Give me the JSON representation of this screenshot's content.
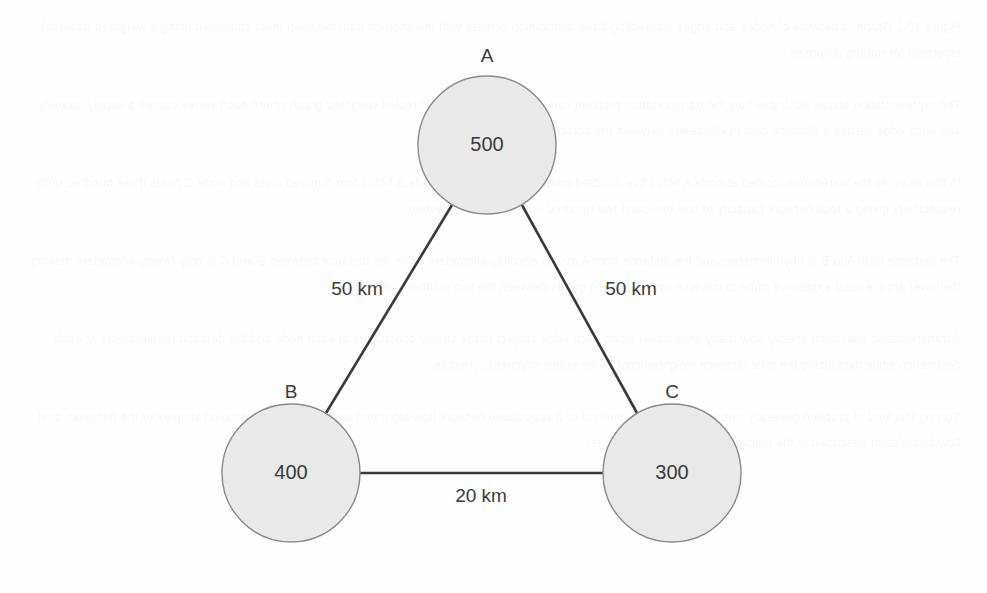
{
  "diagram": {
    "type": "node-link-graph",
    "background_color": "#fefefe",
    "node_fill_color": "#e9e9e9",
    "node_stroke_color": "#8a8a8a",
    "edge_color": "#3a3a3a",
    "text_color": "#3b3b3b",
    "nodes": [
      {
        "id": "A",
        "name": "A",
        "value": "500",
        "cx": 487,
        "cy": 145,
        "r": 69,
        "label_x": 487,
        "label_y": 62
      },
      {
        "id": "B",
        "name": "B",
        "value": "400",
        "cx": 291,
        "cy": 473,
        "r": 69,
        "label_x": 291,
        "label_y": 398
      },
      {
        "id": "C",
        "name": "C",
        "value": "300",
        "cx": 672,
        "cy": 473,
        "r": 69,
        "label_x": 672,
        "label_y": 398
      }
    ],
    "edges": [
      {
        "id": "AB",
        "from": "A",
        "to": "B",
        "label": "50 km",
        "label_x": 357,
        "label_y": 295,
        "x1": 452,
        "y1": 205,
        "x2": 326,
        "y2": 413
      },
      {
        "id": "AC",
        "from": "A",
        "to": "C",
        "label": "50 km",
        "label_x": 631,
        "label_y": 295,
        "x1": 522,
        "y1": 205,
        "x2": 637,
        "y2": 413
      },
      {
        "id": "BC",
        "from": "B",
        "to": "C",
        "label": "20 km",
        "label_x": 481,
        "label_y": 502,
        "x1": 360,
        "y1": 473,
        "x2": 603,
        "y2": 473
      }
    ]
  },
  "ghost_text": "Figure 10-1 Graph  a network of nodes and edges connecting three distribution centers with the shortest path between them computed using a weighted traversal algorithm for routing purposes\n\nThe representation above illustrates how the transportation problem can be modeled as an undirected weighted graph where each vertex carries a supply quantity and each edge carries a distance cost in kilometers between the adjacent facilities\n\nIn this example the warehouse located at node A holds five hundred units of inventory while node B holds four hundred units and node C holds three hundred units respectively giving a total network capacity of one thousand two hundred units across the system\n\nThe distance from A to B is fifty kilometers and the distance from A to C is also fifty kilometers while the distance between B and C is only twenty kilometers making the lower arc the least expensive route to traverse when shipping goods between the two southern centers\n\nA transportation plan must specify how many units travel along each edge subject to the supply constraints at each node and the demand requirements at each destination while minimizing the total distance weighted cost of the entire shipment schedule\n\nSolving this kind of problem generally requires the simplex method or a specialized network flow algorithm such as the transportation simplex or the minimum cost flow formulation described in the following sections of this chapter"
}
